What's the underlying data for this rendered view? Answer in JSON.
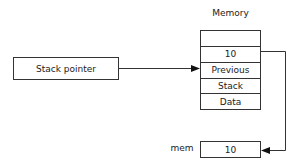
{
  "diagram": {
    "memory_title": "Memory",
    "stack_pointer_label": "Stack pointer",
    "memory_cells": [
      "",
      "10",
      "Previous",
      "Stack",
      "Data"
    ],
    "mem_label": "mem",
    "mem_value": "10"
  },
  "colors": {
    "line": "#333333",
    "background": "#ffffff"
  }
}
